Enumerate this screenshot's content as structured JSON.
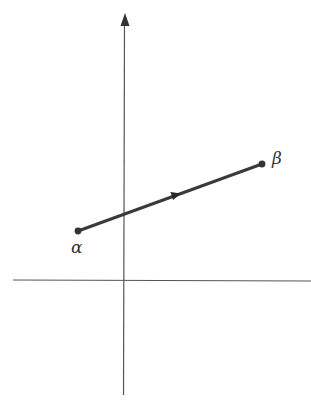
{
  "diagram": {
    "axes": {
      "origin": [
        124,
        280
      ],
      "x_axis": {
        "x1": 13,
        "x2": 311,
        "y": 280,
        "arrow": false
      },
      "y_axis": {
        "x": 124,
        "y1": 395,
        "y2": 12,
        "arrow": true
      }
    },
    "segment": {
      "start": {
        "label": "α",
        "point": [
          78,
          231
        ]
      },
      "end": {
        "label": "β",
        "point": [
          262,
          164
        ]
      },
      "direction_arrow_at": [
        177,
        195
      ],
      "color": "#3a3a3a"
    },
    "colors": {
      "axis": "#555555",
      "segment": "#3a3a3a",
      "background": "#ffffff"
    }
  },
  "labels": {
    "alpha": "α",
    "beta": "β"
  }
}
